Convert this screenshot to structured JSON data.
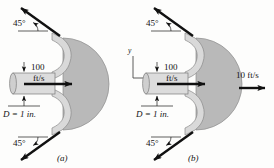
{
  "figure": {
    "panels": [
      {
        "id": "a",
        "caption": "(a)",
        "inlet_speed": "100",
        "inlet_units": "ft/s",
        "diameter_label": "D = 1 in.",
        "angle_top": "45°",
        "angle_bottom": "45°",
        "outlet_speed": null,
        "has_axes": false,
        "axis_x": null,
        "axis_y": null
      },
      {
        "id": "b",
        "caption": "(b)",
        "inlet_speed": "100",
        "inlet_units": "ft/s",
        "diameter_label": "D = 1 in.",
        "angle_top": "45°",
        "angle_bottom": "45°",
        "outlet_speed": "10 ft/s",
        "has_axes": true,
        "axis_x": "x",
        "axis_y": "y"
      }
    ],
    "colors": {
      "vane_fill": "#d9d9d9",
      "disk_fill": "#b9b9b9",
      "pipe_fill": "#dcdcdc",
      "outline": "#6e6e6e",
      "arrow": "#111111",
      "background": "#fdfdfc"
    }
  }
}
